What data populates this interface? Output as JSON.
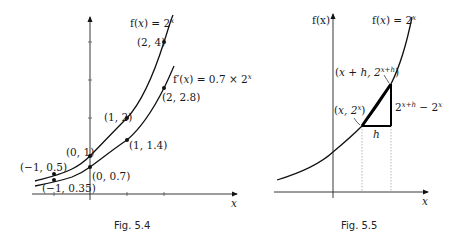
{
  "fig54": {
    "caption": "Fig. 5.4",
    "x_axis_label": "x",
    "curve1_label_prefix": "f(",
    "curve1_label_var": "x",
    "curve1_label_mid": ") = 2",
    "curve1_label_exp": "x",
    "curve2_label_prefix": "f′(",
    "curve2_label_var": "x",
    "curve2_label_mid": ") = 0.7 × 2",
    "curve2_label_exp": "x",
    "points_f": [
      {
        "label": "(−1, 0.5)",
        "x": -1,
        "y": 0.5
      },
      {
        "label": "(0, 1)",
        "x": 0,
        "y": 1
      },
      {
        "label": "(1, 2)",
        "x": 1,
        "y": 2
      },
      {
        "label": "(2, 4)",
        "x": 2,
        "y": 4
      }
    ],
    "points_fprime": [
      {
        "label": "(−1, 0.35)",
        "x": -1,
        "y": 0.35
      },
      {
        "label": "(0, 0.7)",
        "x": 0,
        "y": 0.7
      },
      {
        "label": "(1, 1.4)",
        "x": 1,
        "y": 1.4
      },
      {
        "label": "(2, 2.8)",
        "x": 2,
        "y": 2.8
      }
    ]
  },
  "fig55": {
    "caption": "Fig. 5.5",
    "x_axis_label": "x",
    "y_axis_label": "f(x)",
    "curve_label_prefix": "f(",
    "curve_label_var": "x",
    "curve_label_mid": ") = 2",
    "curve_label_exp": "x",
    "point_lower_label": "(x, 2^x)",
    "point_lower_base": "x, 2",
    "point_lower_exp": "x",
    "point_upper_base": "x + h, 2",
    "point_upper_exp": "x+h",
    "rise_base1": "2",
    "rise_exp1": "x+h",
    "rise_mid": " − 2",
    "rise_exp2": "x",
    "run_label": "h"
  }
}
